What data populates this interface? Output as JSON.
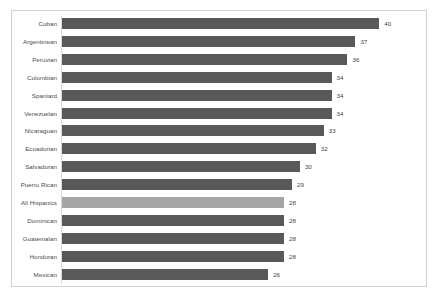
{
  "chart_data": {
    "type": "bar",
    "orientation": "horizontal",
    "title": "",
    "subtitle": "",
    "xlabel": "",
    "ylabel": "",
    "xlim": [
      0,
      40
    ],
    "grid": false,
    "legend": false,
    "data_labels": true,
    "categories": [
      "Cuban",
      "Argentinean",
      "Peruvian",
      "Colombian",
      "Spaniard",
      "Venezuelan",
      "Nicaraguan",
      "Ecuadorian",
      "Salvadoran",
      "Puerto Rican",
      "All Hispanics",
      "Dominican",
      "Guatemalan",
      "Honduran",
      "Mexican"
    ],
    "values": [
      40,
      37,
      36,
      34,
      34,
      34,
      33,
      32,
      30,
      29,
      28,
      28,
      28,
      28,
      26
    ],
    "value_labels": [
      "40",
      "37",
      "36",
      "34",
      "34",
      "34",
      "33",
      "32",
      "30",
      "29",
      "28",
      "28",
      "28",
      "28",
      "26"
    ],
    "highlighted_category": "All Hispanics",
    "colors": {
      "bar": "#595959",
      "bar_highlight": "#a5a5a5",
      "axis_line": "#d9d9d9",
      "frame_border": "#d0d0d0",
      "label_text": "#4a4a4a",
      "value_text": "#3f3f3f",
      "background": "#ffffff"
    }
  }
}
